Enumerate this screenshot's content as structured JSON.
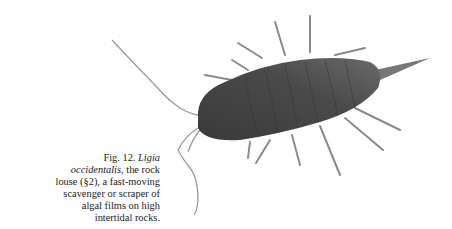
{
  "figure": {
    "label": "Fig. 12.",
    "species": "Ligia occidentalis,",
    "caption_rest": " the rock louse (§2), a fast-moving scavenger or scraper of algal films on high intertidal rocks.",
    "image_subject": "rock louse (Ligia occidentalis) photograph"
  }
}
